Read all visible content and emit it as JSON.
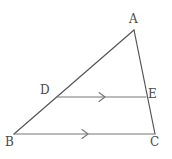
{
  "figure": {
    "background_color": "#ffffff",
    "stroke_color": "#555555",
    "label_color": "#4a4a4a",
    "stroke_width": 1.2,
    "canvas": {
      "width": 172,
      "height": 159
    },
    "points": {
      "A": {
        "label": "A",
        "x": 134,
        "y": 30,
        "label_x": 129,
        "label_y": 13
      },
      "B": {
        "label": "B",
        "x": 14,
        "y": 134,
        "label_x": 5,
        "label_y": 136
      },
      "C": {
        "label": "C",
        "x": 155,
        "y": 134,
        "label_x": 150,
        "label_y": 136
      },
      "D": {
        "label": "D",
        "x": 57,
        "y": 97,
        "label_x": 40,
        "label_y": 84
      },
      "E": {
        "label": "E",
        "x": 146,
        "y": 97,
        "label_x": 148,
        "label_y": 88
      }
    },
    "segments": [
      {
        "name": "segment-AB",
        "from": "A",
        "to": "B",
        "arrow_marks": 0
      },
      {
        "name": "segment-AC",
        "from": "A",
        "to": "C",
        "arrow_marks": 0
      },
      {
        "name": "segment-BC",
        "from": "B",
        "to": "C",
        "arrow_marks": 1
      },
      {
        "name": "segment-DE",
        "from": "D",
        "to": "E",
        "arrow_marks": 1
      }
    ],
    "parallel_marks": [
      {
        "name": "parallel-mark-DE",
        "on_segment": "DE",
        "x": 102,
        "y": 97,
        "glyph": ">"
      },
      {
        "name": "parallel-mark-BC",
        "on_segment": "BC",
        "x": 85,
        "y": 134,
        "glyph": ">"
      }
    ]
  }
}
